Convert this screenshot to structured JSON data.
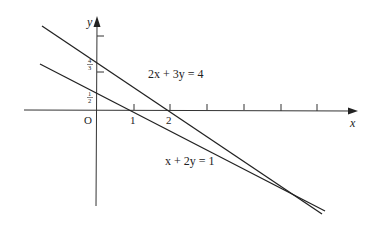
{
  "diagram": {
    "title": "",
    "axes": {
      "x_label": "x",
      "y_label": "y",
      "origin_label": "O",
      "x_tick_labels": [
        "1",
        "2"
      ],
      "x_ticks_count": 7,
      "y_tick_labels": [
        "1/2",
        "4/3"
      ]
    },
    "lines": [
      {
        "equation": "2x + 3y = 4",
        "x_intercept": 2,
        "y_intercept": "4/3"
      },
      {
        "equation": "x + 2y = 1",
        "x_intercept": 1,
        "y_intercept": "1/2"
      }
    ],
    "labels": {
      "line1": "2x + 3y = 4",
      "line2": "x + 2y = 1",
      "frac_4_3_num": "4",
      "frac_4_3_den": "3",
      "frac_1_2_num": "1",
      "frac_1_2_den": "2"
    },
    "colors": {
      "stroke": "#222222",
      "background": "#ffffff"
    }
  }
}
